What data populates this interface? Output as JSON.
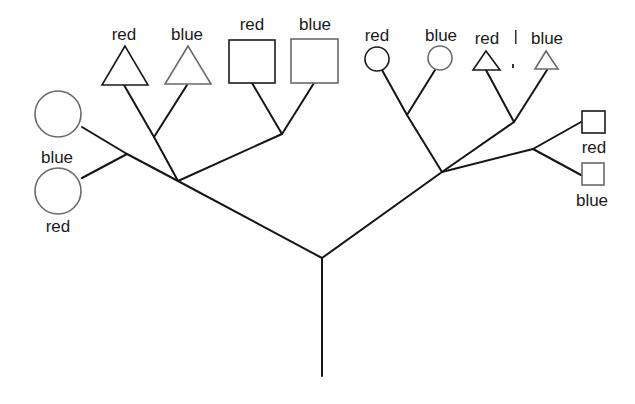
{
  "diagram": {
    "type": "tree",
    "leaves": [
      {
        "id": "l1",
        "shape": "circle",
        "label": "blue",
        "size": "large"
      },
      {
        "id": "l2",
        "shape": "circle",
        "label": "red",
        "size": "large"
      },
      {
        "id": "l3",
        "shape": "triangle",
        "label": "red",
        "size": "large"
      },
      {
        "id": "l4",
        "shape": "triangle",
        "label": "blue",
        "size": "large"
      },
      {
        "id": "l5",
        "shape": "square",
        "label": "red",
        "size": "large"
      },
      {
        "id": "l6",
        "shape": "square",
        "label": "blue",
        "size": "large"
      },
      {
        "id": "l7",
        "shape": "circle",
        "label": "red",
        "size": "small"
      },
      {
        "id": "l8",
        "shape": "circle",
        "label": "blue",
        "size": "small"
      },
      {
        "id": "l9",
        "shape": "triangle",
        "label": "red",
        "size": "small"
      },
      {
        "id": "l10",
        "shape": "triangle",
        "label": "blue",
        "size": "small"
      },
      {
        "id": "l11",
        "shape": "square",
        "label": "red",
        "size": "small"
      },
      {
        "id": "l12",
        "shape": "square",
        "label": "blue",
        "size": "small"
      }
    ],
    "structure": {
      "root": {
        "children": [
          {
            "name": "left-subtree (large shapes)",
            "children": [
              {
                "name": "circles",
                "leaves": [
                  "l1",
                  "l2"
                ]
              },
              {
                "name": "triangles",
                "leaves": [
                  "l3",
                  "l4"
                ]
              },
              {
                "name": "squares",
                "leaves": [
                  "l5",
                  "l6"
                ]
              }
            ]
          },
          {
            "name": "right-subtree (small shapes)",
            "children": [
              {
                "name": "circles",
                "leaves": [
                  "l7",
                  "l8"
                ]
              },
              {
                "name": "triangles",
                "leaves": [
                  "l9",
                  "l10"
                ]
              },
              {
                "name": "squares",
                "leaves": [
                  "l11",
                  "l12"
                ]
              }
            ]
          }
        ]
      }
    },
    "labels": {
      "l1": "blue",
      "l2": "red",
      "l3": "red",
      "l4": "blue",
      "l5": "red",
      "l6": "blue",
      "l7": "red",
      "l8": "blue",
      "l9": "red",
      "l10": "blue",
      "l11": "red",
      "l12": "blue"
    },
    "colors": {
      "line": "#151515",
      "dark_outline": "#1a1a1a",
      "light_outline": "#6a6a6a",
      "background": "#ffffff"
    }
  }
}
